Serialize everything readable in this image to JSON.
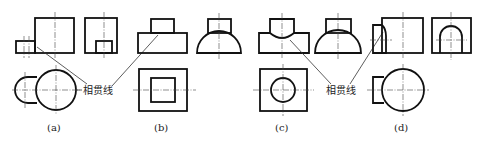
{
  "figure": {
    "type": "engineering-drawing",
    "annotations": [
      {
        "id": "left",
        "text": "相贯线",
        "x": 83,
        "y": 93
      },
      {
        "id": "right",
        "text": "相贯线",
        "x": 326,
        "y": 93
      }
    ],
    "subfigures": [
      {
        "id": "a",
        "label": "(a)",
        "label_x": 47,
        "label_y": 131,
        "description": "cylinder with smaller horizontal half-cylinder boss"
      },
      {
        "id": "b",
        "label": "(b)",
        "label_x": 154,
        "label_y": 131,
        "description": "square prism on rectangular block / half cylinder"
      },
      {
        "id": "c",
        "label": "(c)",
        "label_x": 275,
        "label_y": 131,
        "description": "vertical cylinder intersecting horizontal half-cylinder"
      },
      {
        "id": "d",
        "label": "(d)",
        "label_x": 394,
        "label_y": 131,
        "description": "cylinder with side block and arched hole"
      }
    ]
  }
}
